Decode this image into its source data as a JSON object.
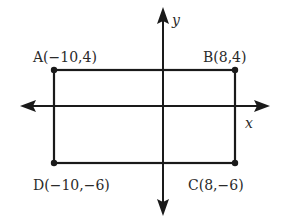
{
  "diagram": {
    "type": "coordinate-plane-rectangle",
    "axes": {
      "x_label": "x",
      "y_label": "y"
    },
    "points": [
      {
        "name": "A",
        "label": "A(−10,4)",
        "x": -10,
        "y": 4
      },
      {
        "name": "B",
        "label": "B(8,4)",
        "x": 8,
        "y": 4
      },
      {
        "name": "C",
        "label": "C(8,−6)",
        "x": 8,
        "y": -6
      },
      {
        "name": "D",
        "label": "D(−10,−6)",
        "x": -10,
        "y": -6
      }
    ],
    "colors": {
      "line": "#1a1a1a",
      "text": "#2a2a2a",
      "background": "#ffffff"
    }
  }
}
